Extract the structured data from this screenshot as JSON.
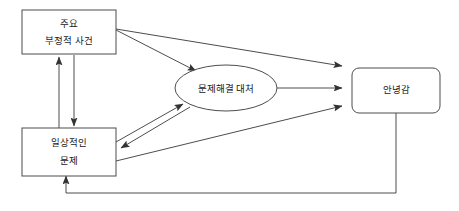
{
  "diagram": {
    "background_color": "#ffffff",
    "line_color": "#4d4d4d",
    "text_color": "#1a1a1a",
    "nodes": [
      {
        "id": "major-negative-events",
        "shape": "rectangle",
        "line1": "주요",
        "line2": "부정적 사건"
      },
      {
        "id": "daily-problems",
        "shape": "rectangle",
        "line1": "일상적인",
        "line2": "문제"
      },
      {
        "id": "problem-solving-coping",
        "shape": "ellipse",
        "line1": "문제해결 대처"
      },
      {
        "id": "wellbeing",
        "shape": "rounded-rectangle",
        "line1": "안녕감"
      }
    ],
    "edges": [
      {
        "id": "major-events-to-coping",
        "from": "major-negative-events",
        "to": "problem-solving-coping",
        "direction": "one-way"
      },
      {
        "id": "major-events-to-wellbeing",
        "from": "major-negative-events",
        "to": "wellbeing",
        "direction": "one-way"
      },
      {
        "id": "daily-problems-to-major-events",
        "from": "daily-problems",
        "to": "major-negative-events",
        "direction": "one-way"
      },
      {
        "id": "major-events-to-daily-problems",
        "from": "major-negative-events",
        "to": "daily-problems",
        "direction": "one-way"
      },
      {
        "id": "daily-problems-to-coping",
        "from": "daily-problems",
        "to": "problem-solving-coping",
        "direction": "one-way"
      },
      {
        "id": "coping-to-daily-problems",
        "from": "problem-solving-coping",
        "to": "daily-problems",
        "direction": "one-way"
      },
      {
        "id": "daily-problems-to-wellbeing",
        "from": "daily-problems",
        "to": "wellbeing",
        "direction": "one-way"
      },
      {
        "id": "coping-to-wellbeing",
        "from": "problem-solving-coping",
        "to": "wellbeing",
        "direction": "one-way"
      },
      {
        "id": "wellbeing-to-daily-problems-feedback",
        "from": "wellbeing",
        "to": "daily-problems",
        "direction": "one-way"
      }
    ]
  }
}
